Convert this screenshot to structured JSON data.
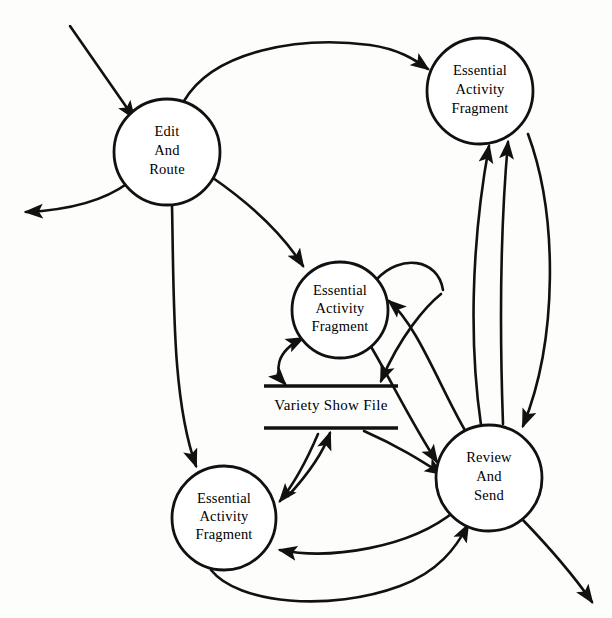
{
  "diagram": {
    "type": "data-flow-diagram",
    "width": 612,
    "height": 618,
    "stroke_color": "#111111",
    "background_color": "#fdfdfb"
  },
  "processes": [
    {
      "id": "edit-and-route",
      "lines": [
        "Edit",
        "And",
        "Route"
      ],
      "line1": "Edit",
      "line2": "And",
      "line3": "Route",
      "cx": 167,
      "cy": 152,
      "r": 53
    },
    {
      "id": "eaf-top-right",
      "lines": [
        "Essential",
        "Activity",
        "Fragment"
      ],
      "line1": "Essential",
      "line2": "Activity",
      "line3": "Fragment",
      "cx": 480,
      "cy": 91,
      "r": 53
    },
    {
      "id": "eaf-center",
      "lines": [
        "Essential",
        "Activity",
        "Fragment"
      ],
      "line1": "Essential",
      "line2": "Activity",
      "line3": "Fragment",
      "cx": 340,
      "cy": 310,
      "r": 48
    },
    {
      "id": "eaf-bottom-left",
      "lines": [
        "Essential",
        "Activity",
        "Fragment"
      ],
      "line1": "Essential",
      "line2": "Activity",
      "line3": "Fragment",
      "cx": 224,
      "cy": 518,
      "r": 52
    },
    {
      "id": "review-and-send",
      "lines": [
        "Review",
        "And",
        "Send"
      ],
      "line1": "Review",
      "line2": "And",
      "line3": "Send",
      "cx": 489,
      "cy": 478,
      "r": 53
    }
  ],
  "data_stores": [
    {
      "id": "variety-show-file",
      "label": "Variety Show File",
      "cx": 331,
      "top_y": 386,
      "bottom_y": 428,
      "x1": 264,
      "x2": 398
    }
  ],
  "flows": [
    {
      "id": "external-in-to-edit",
      "from": "external",
      "to": "edit-and-route",
      "arrow": "single"
    },
    {
      "id": "edit-to-external-out",
      "from": "edit-and-route",
      "to": "external",
      "arrow": "single"
    },
    {
      "id": "edit-to-eaf-top-right",
      "from": "edit-and-route",
      "to": "eaf-top-right",
      "arrow": "single"
    },
    {
      "id": "edit-to-eaf-center",
      "from": "edit-and-route",
      "to": "eaf-center",
      "arrow": "single"
    },
    {
      "id": "edit-to-eaf-bottom-left",
      "from": "edit-and-route",
      "to": "eaf-bottom-left",
      "arrow": "single"
    },
    {
      "id": "eaf-center-to-store",
      "from": "eaf-center",
      "to": "variety-show-file",
      "arrow": "double"
    },
    {
      "id": "review-to-store",
      "from": "review-and-send",
      "to": "variety-show-file",
      "arrow": "single"
    },
    {
      "id": "store-to-review",
      "from": "variety-show-file",
      "to": "review-and-send",
      "arrow": "single"
    },
    {
      "id": "eaf-bottom-left-to-store",
      "from": "eaf-bottom-left",
      "to": "variety-show-file",
      "arrow": "single"
    },
    {
      "id": "store-to-eaf-bottom-left",
      "from": "variety-show-file",
      "to": "eaf-bottom-left",
      "arrow": "single"
    },
    {
      "id": "review-to-eaf-center",
      "from": "review-and-send",
      "to": "eaf-center",
      "arrow": "single"
    },
    {
      "id": "eaf-bottom-left-to-review",
      "from": "eaf-bottom-left",
      "to": "review-and-send",
      "arrow": "single"
    },
    {
      "id": "review-to-eaf-bottom-left",
      "from": "review-and-send",
      "to": "eaf-bottom-left",
      "arrow": "single"
    },
    {
      "id": "review-to-eaf-top-right-a",
      "from": "review-and-send",
      "to": "eaf-top-right",
      "arrow": "single"
    },
    {
      "id": "review-to-eaf-top-right-b",
      "from": "review-and-send",
      "to": "eaf-top-right",
      "arrow": "single"
    },
    {
      "id": "eaf-top-right-to-review",
      "from": "eaf-top-right",
      "to": "review-and-send",
      "arrow": "single"
    },
    {
      "id": "eaf-center-out-to-review",
      "from": "eaf-center",
      "to": "review-and-send",
      "arrow": "single"
    },
    {
      "id": "review-to-external-out",
      "from": "review-and-send",
      "to": "external",
      "arrow": "single"
    }
  ]
}
